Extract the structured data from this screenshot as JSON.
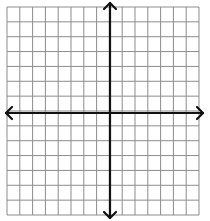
{
  "diagram": {
    "type": "coordinate-plane",
    "grid": {
      "columns": 15,
      "rows": 14,
      "left": 7,
      "top": 7,
      "right": 199,
      "bottom": 215,
      "line_color": "#8c8c8c",
      "line_width": 1
    },
    "axes": {
      "x_axis_y": 113,
      "y_axis_x": 110,
      "color": "#111111",
      "width": 2.2,
      "x_extent": [
        6,
        203
      ],
      "y_extent": [
        3,
        218
      ],
      "arrows": [
        "left",
        "right",
        "up",
        "down"
      ]
    },
    "labels": []
  }
}
